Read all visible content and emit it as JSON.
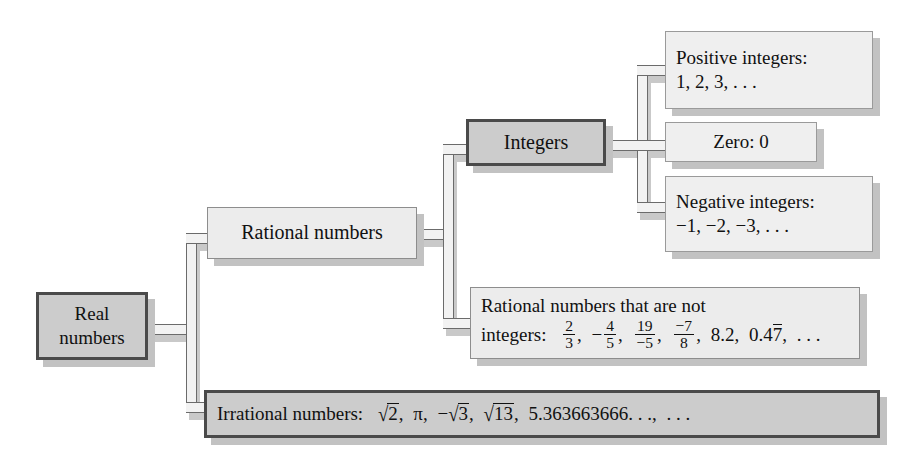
{
  "diagram": {
    "type": "classification-tree",
    "root": "Real numbers",
    "orientation": "left-to-right",
    "background_color": "#ffffff",
    "primary_fill": "#cccccc",
    "secondary_fill": "#ececec",
    "border_color": "#4a4a4a",
    "shadow_color": "#c2c2c2"
  },
  "nodes": {
    "real": {
      "label": "Real numbers",
      "line1": "Real",
      "line2": "numbers",
      "level": 0,
      "style": "primary"
    },
    "rational": {
      "label": "Rational numbers",
      "level": 1,
      "style": "secondary"
    },
    "irrational": {
      "label_prefix": "Irrational numbers:",
      "examples": "√2, π, −√3, √13, 5.363663666. . . , . . .",
      "level": 1,
      "style": "primary"
    },
    "integers": {
      "label": "Integers",
      "level": 2,
      "style": "primary"
    },
    "rational_not_integers": {
      "line1": "Rational numbers that are not",
      "line2_prefix": "integers:",
      "examples": "2/3, −4/5, 19/−5, −7/8, 8.2, 0.47̅, . . .",
      "level": 2,
      "style": "secondary"
    },
    "positive_integers": {
      "line1": "Positive integers:",
      "line2": "1, 2, 3, . . .",
      "level": 3,
      "style": "leaf"
    },
    "zero": {
      "label": "Zero: 0",
      "level": 3,
      "style": "leaf"
    },
    "negative_integers": {
      "line1": "Negative integers:",
      "line2": "−1, −2, −3, . . .",
      "level": 3,
      "style": "leaf"
    }
  },
  "math": {
    "frac_2_3": {
      "num": "2",
      "den": "3"
    },
    "frac_4_5": {
      "sign": "−",
      "num": "4",
      "den": "5"
    },
    "frac_19_m5": {
      "num": "19",
      "den": "−5"
    },
    "frac_m7_8": {
      "num": "−7",
      "den": "8"
    },
    "decimal_8_2": "8.2",
    "repeating_decimal": {
      "lead": "0.4",
      "repeat": "7"
    },
    "sqrt2": "2",
    "pi": "π",
    "neg_sqrt3": "3",
    "sqrt13": "13",
    "long_decimal": "5.363663666. . .",
    "ellipsis": ". . .",
    "comma": ",",
    "radical_sign": "√"
  },
  "edges": [
    {
      "from": "real",
      "to": "rational"
    },
    {
      "from": "real",
      "to": "irrational"
    },
    {
      "from": "rational",
      "to": "integers"
    },
    {
      "from": "rational",
      "to": "rational_not_integers"
    },
    {
      "from": "integers",
      "to": "positive_integers"
    },
    {
      "from": "integers",
      "to": "zero"
    },
    {
      "from": "integers",
      "to": "negative_integers"
    }
  ]
}
